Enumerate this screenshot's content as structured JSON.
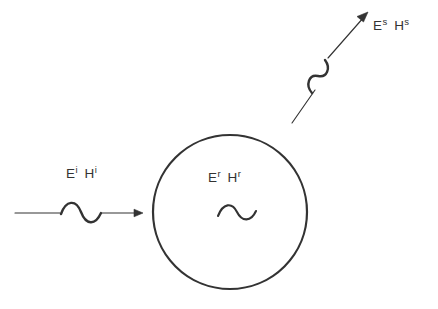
{
  "figure": {
    "type": "diagram",
    "background_color": "#ffffff",
    "stroke_color": "#333333",
    "width": 438,
    "height": 309
  },
  "labels": {
    "incident": {
      "name": "incident-field-label",
      "text": "E^i H^i",
      "field_e": "E",
      "field_e_sup": "i",
      "field_h": "H",
      "field_h_sup": "i"
    },
    "interior": {
      "name": "interior-field-label",
      "text": "E^r H^r",
      "field_e": "E",
      "field_e_sup": "r",
      "field_h": "H",
      "field_h_sup": "r"
    },
    "scattered": {
      "name": "scattered-field-label",
      "text": "E^s H^s",
      "field_e": "E",
      "field_e_sup": "s",
      "field_h": "H",
      "field_h_sup": "s"
    }
  },
  "shapes": {
    "scatterer": {
      "name": "scatterer-circle",
      "cx": 230,
      "cy": 212,
      "r": 77
    },
    "incident_arrow": {
      "name": "incident-wave-arrow",
      "start_x": 15,
      "start_y": 213,
      "end_x": 143,
      "end_y": 213,
      "direction": "left-to-right"
    },
    "scattered_arrow": {
      "name": "scattered-wave-arrow",
      "start_x": 292,
      "start_y": 123,
      "end_x": 368,
      "end_y": 12,
      "direction": "lower-left-to-upper-right"
    },
    "incident_wave_symbol": {
      "name": "incident-sine-squiggle"
    },
    "interior_wave_symbol": {
      "name": "interior-sine-squiggle"
    },
    "scattered_wave_symbol": {
      "name": "scattered-sine-squiggle"
    }
  }
}
